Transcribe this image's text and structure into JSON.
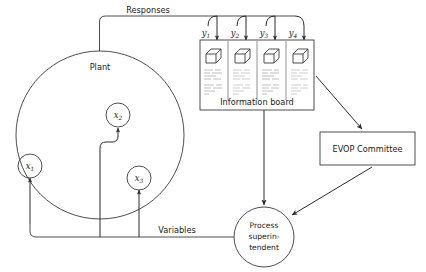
{
  "diagram": {
    "title_labels": {
      "responses": "Responses",
      "variables": "Variables",
      "plant": "Plant",
      "information_board": "Information board"
    },
    "nodes": {
      "plant": {
        "label": "Plant",
        "shape": "circle"
      },
      "x1": {
        "base": "x",
        "sub": "1"
      },
      "x2": {
        "base": "x",
        "sub": "2"
      },
      "x3": {
        "base": "x",
        "sub": "3"
      },
      "evop": {
        "label": "EVOP Committee",
        "shape": "rectangle"
      },
      "superintendent": {
        "line1": "Process",
        "line2": "superin-",
        "line3": "tendent",
        "shape": "circle"
      }
    },
    "responses": [
      {
        "base": "y",
        "sub": "1"
      },
      {
        "base": "y",
        "sub": "2"
      },
      {
        "base": "y",
        "sub": "3"
      },
      {
        "base": "y",
        "sub": "4"
      }
    ],
    "board_panels": [
      {
        "icon": "cube-icon"
      },
      {
        "icon": "cube-icon"
      },
      {
        "icon": "cube-icon"
      },
      {
        "icon": "cube-icon"
      }
    ],
    "colors": {
      "stroke": "#3a3a3a",
      "arrow": "#2b2b2b",
      "text": "#1a1a1a",
      "background": "#ffffff",
      "scribble": "#8a8a8a"
    }
  }
}
